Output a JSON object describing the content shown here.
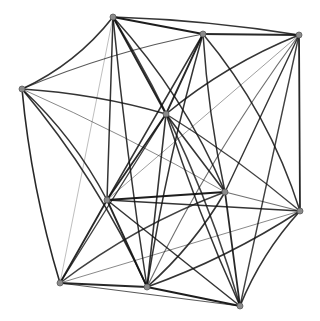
{
  "diagram": {
    "type": "graph-drawing",
    "edge_color": "#111111",
    "node_color": "#8a8a8a",
    "nodes": [
      {
        "id": "A",
        "x": 113,
        "y": 17
      },
      {
        "id": "B",
        "x": 203,
        "y": 34
      },
      {
        "id": "C",
        "x": 299,
        "y": 35
      },
      {
        "id": "D",
        "x": 22,
        "y": 89
      },
      {
        "id": "E",
        "x": 166,
        "y": 114
      },
      {
        "id": "F",
        "x": 107,
        "y": 200
      },
      {
        "id": "G",
        "x": 225,
        "y": 192
      },
      {
        "id": "H",
        "x": 300,
        "y": 211
      },
      {
        "id": "I",
        "x": 60,
        "y": 283
      },
      {
        "id": "J",
        "x": 147,
        "y": 287
      },
      {
        "id": "K",
        "x": 240,
        "y": 306
      }
    ],
    "edges": [
      {
        "from": "A",
        "to": "B",
        "bend": 0,
        "w": 2.0,
        "o": 0.95
      },
      {
        "from": "A",
        "to": "C",
        "bend": -6,
        "w": 1.6,
        "o": 0.85
      },
      {
        "from": "A",
        "to": "D",
        "bend": -14,
        "w": 1.6,
        "o": 0.85
      },
      {
        "from": "A",
        "to": "E",
        "bend": 0,
        "w": 1.8,
        "o": 0.9
      },
      {
        "from": "A",
        "to": "F",
        "bend": 0,
        "w": 1.5,
        "o": 0.85
      },
      {
        "from": "A",
        "to": "G",
        "bend": -18,
        "w": 1.5,
        "o": 0.85
      },
      {
        "from": "A",
        "to": "J",
        "bend": 4,
        "w": 1.5,
        "o": 0.85
      },
      {
        "from": "A",
        "to": "K",
        "bend": -22,
        "w": 1.5,
        "o": 0.8
      },
      {
        "from": "B",
        "to": "C",
        "bend": 0,
        "w": 1.8,
        "o": 0.9
      },
      {
        "from": "B",
        "to": "D",
        "bend": 10,
        "w": 1.2,
        "o": 0.7
      },
      {
        "from": "B",
        "to": "E",
        "bend": 0,
        "w": 1.8,
        "o": 0.9
      },
      {
        "from": "B",
        "to": "F",
        "bend": 0,
        "w": 1.5,
        "o": 0.85
      },
      {
        "from": "B",
        "to": "G",
        "bend": 6,
        "w": 1.5,
        "o": 0.85
      },
      {
        "from": "B",
        "to": "H",
        "bend": -20,
        "w": 1.5,
        "o": 0.85
      },
      {
        "from": "B",
        "to": "J",
        "bend": 8,
        "w": 1.5,
        "o": 0.85
      },
      {
        "from": "C",
        "to": "E",
        "bend": 12,
        "w": 1.6,
        "o": 0.85
      },
      {
        "from": "C",
        "to": "H",
        "bend": 0,
        "w": 1.8,
        "o": 0.9
      },
      {
        "from": "C",
        "to": "G",
        "bend": 0,
        "w": 1.4,
        "o": 0.85
      },
      {
        "from": "C",
        "to": "K",
        "bend": 0,
        "w": 1.4,
        "o": 0.8
      },
      {
        "from": "C",
        "to": "J",
        "bend": 14,
        "w": 1.2,
        "o": 0.6
      },
      {
        "from": "D",
        "to": "E",
        "bend": -8,
        "w": 1.6,
        "o": 0.85
      },
      {
        "from": "D",
        "to": "F",
        "bend": -12,
        "w": 1.5,
        "o": 0.85
      },
      {
        "from": "D",
        "to": "I",
        "bend": 10,
        "w": 1.6,
        "o": 0.9
      },
      {
        "from": "D",
        "to": "J",
        "bend": -16,
        "w": 1.6,
        "o": 0.85
      },
      {
        "from": "D",
        "to": "G",
        "bend": -6,
        "w": 1.0,
        "o": 0.5
      },
      {
        "from": "E",
        "to": "F",
        "bend": 0,
        "w": 1.8,
        "o": 0.9
      },
      {
        "from": "E",
        "to": "G",
        "bend": 0,
        "w": 1.6,
        "o": 0.85
      },
      {
        "from": "E",
        "to": "H",
        "bend": -6,
        "w": 1.4,
        "o": 0.8
      },
      {
        "from": "E",
        "to": "I",
        "bend": 0,
        "w": 1.4,
        "o": 0.8
      },
      {
        "from": "E",
        "to": "J",
        "bend": 0,
        "w": 1.6,
        "o": 0.85
      },
      {
        "from": "E",
        "to": "K",
        "bend": 6,
        "w": 1.5,
        "o": 0.85
      },
      {
        "from": "F",
        "to": "G",
        "bend": 0,
        "w": 2.0,
        "o": 0.95
      },
      {
        "from": "F",
        "to": "H",
        "bend": 0,
        "w": 1.5,
        "o": 0.85
      },
      {
        "from": "F",
        "to": "I",
        "bend": 0,
        "w": 1.8,
        "o": 0.9
      },
      {
        "from": "F",
        "to": "J",
        "bend": 0,
        "w": 1.8,
        "o": 0.9
      },
      {
        "from": "F",
        "to": "K",
        "bend": 0,
        "w": 1.5,
        "o": 0.85
      },
      {
        "from": "F",
        "to": "C",
        "bend": 0,
        "w": 1.0,
        "o": 0.4
      },
      {
        "from": "G",
        "to": "H",
        "bend": 0,
        "w": 1.2,
        "o": 0.6
      },
      {
        "from": "G",
        "to": "I",
        "bend": 14,
        "w": 1.4,
        "o": 0.8
      },
      {
        "from": "G",
        "to": "J",
        "bend": -10,
        "w": 1.6,
        "o": 0.85
      },
      {
        "from": "G",
        "to": "K",
        "bend": 0,
        "w": 1.8,
        "o": 0.9
      },
      {
        "from": "H",
        "to": "J",
        "bend": -10,
        "w": 1.5,
        "o": 0.85
      },
      {
        "from": "H",
        "to": "K",
        "bend": 10,
        "w": 1.6,
        "o": 0.85
      },
      {
        "from": "H",
        "to": "I",
        "bend": 0,
        "w": 1.0,
        "o": 0.5
      },
      {
        "from": "I",
        "to": "J",
        "bend": 0,
        "w": 1.8,
        "o": 0.9
      },
      {
        "from": "I",
        "to": "K",
        "bend": 0,
        "w": 1.2,
        "o": 0.7
      },
      {
        "from": "J",
        "to": "K",
        "bend": 0,
        "w": 2.0,
        "o": 0.95
      },
      {
        "from": "A",
        "to": "I",
        "bend": 0,
        "w": 0.8,
        "o": 0.35
      }
    ]
  }
}
